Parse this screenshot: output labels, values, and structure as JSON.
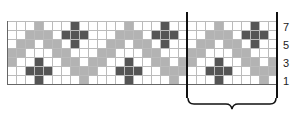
{
  "grid": {
    "columns": 30,
    "rows": 7,
    "period": 10,
    "colors": {
      "W": "#ffffff",
      "L": "#b3b3b3",
      "D": "#555555"
    },
    "pattern_rows_top_to_bottom": [
      "WWWLWWWDWW",
      "WWLLLWDDDW",
      "WLLWLLWDWW",
      "LLWWWLLWWW",
      "LWWDWWLLWL",
      "WWDDDWWLLL",
      "WWWDWWWWLW"
    ]
  },
  "row_labels": [
    {
      "text": "7",
      "row": 7
    },
    {
      "text": "5",
      "row": 5
    },
    {
      "text": "3",
      "row": 3
    },
    {
      "text": "1",
      "row": 1
    }
  ],
  "repeat_bracket": {
    "from_column": 20,
    "to_column": 30
  }
}
